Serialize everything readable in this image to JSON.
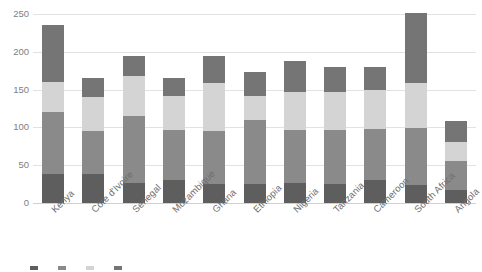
{
  "chart_data": {
    "type": "bar",
    "subtype": "stacked-vertical",
    "title": "",
    "xlabel": "",
    "ylabel": "",
    "ylim": [
      0,
      250
    ],
    "yticks": [
      0,
      50,
      100,
      150,
      200,
      250
    ],
    "ytick_labels": [
      "0",
      "50",
      "100",
      "150",
      "200",
      "250"
    ],
    "grid": true,
    "legend_position": "bottom",
    "categories": [
      "Kenya",
      "Côte d'Ivoire",
      "Senegal",
      "Mozambique",
      "Ghana",
      "Ethiopia",
      "Nigeria",
      "Tanzania",
      "Cameroon",
      "South Africa",
      "Angola"
    ],
    "series": [
      {
        "name": "Series 1",
        "color": "#5e5e5e",
        "values": [
          39,
          38,
          27,
          31,
          25,
          25,
          26,
          25,
          30,
          24,
          17
        ]
      },
      {
        "name": "Series 2",
        "color": "#8a8a8a",
        "values": [
          81,
          57,
          88,
          66,
          70,
          85,
          71,
          72,
          68,
          75,
          38
        ]
      },
      {
        "name": "Series 3",
        "color": "#d4d4d4",
        "values": [
          40,
          45,
          53,
          44,
          64,
          31,
          50,
          50,
          52,
          60,
          26
        ]
      },
      {
        "name": "Series 4",
        "color": "#757575",
        "values": [
          76,
          25,
          27,
          25,
          35,
          32,
          41,
          33,
          30,
          93,
          27
        ]
      }
    ],
    "totals": [
      236,
      165,
      195,
      166,
      194,
      173,
      188,
      180,
      180,
      252,
      108
    ]
  },
  "legend": {
    "items": [
      {
        "label": "",
        "color": "#5e5e5e"
      },
      {
        "label": "",
        "color": "#8a8a8a"
      },
      {
        "label": "",
        "color": "#d4d4d4"
      },
      {
        "label": "",
        "color": "#757575"
      }
    ]
  }
}
